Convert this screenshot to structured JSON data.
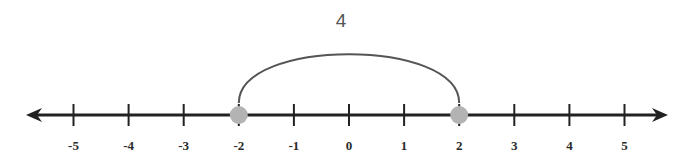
{
  "diagram": {
    "type": "number-line",
    "min": -5,
    "max": 5,
    "step": 1,
    "tick_labels": [
      "-5",
      "-4",
      "-3",
      "-2",
      "-1",
      "0",
      "1",
      "2",
      "3",
      "4",
      "5"
    ],
    "points": [
      {
        "value": -2,
        "color": "#b3b3b3"
      },
      {
        "value": 2,
        "color": "#b3b3b3"
      }
    ],
    "distance_arc": {
      "from": -2,
      "to": 2,
      "label": "4"
    },
    "colors": {
      "line": "#222222",
      "arc": "#555555",
      "point": "#b3b3b3"
    }
  }
}
